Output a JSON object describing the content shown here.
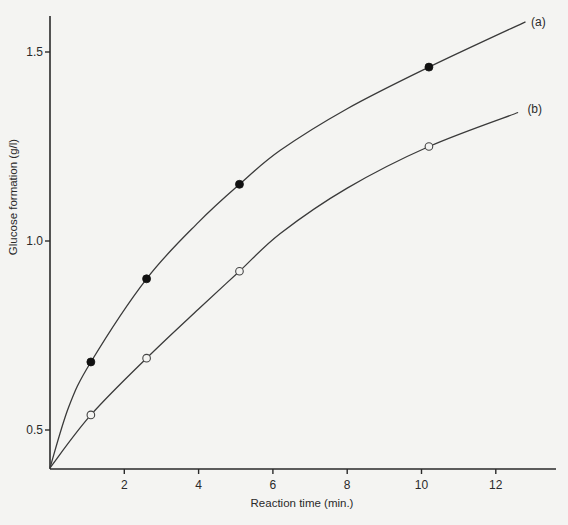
{
  "chart_data": {
    "type": "line",
    "title": "",
    "xlabel": "Reaction time (min.)",
    "ylabel": "Glucose formation (g/l)",
    "xlim": [
      0,
      13.6
    ],
    "ylim": [
      0.4,
      1.62
    ],
    "xticks": [
      2,
      4,
      6,
      8,
      10,
      12
    ],
    "xtick_labels": [
      "2",
      "4",
      "6",
      "8",
      "10",
      "12"
    ],
    "yticks": [
      0.5,
      1.0,
      1.5
    ],
    "ytick_labels": [
      "0.5",
      "1.0",
      "1.5"
    ],
    "grid": false,
    "legend": "inline curve labels at right end",
    "series": [
      {
        "name": "(a)",
        "marker": "filled-circle",
        "points": [
          {
            "x": 1.1,
            "y": 0.68
          },
          {
            "x": 2.6,
            "y": 0.9
          },
          {
            "x": 5.1,
            "y": 1.15
          },
          {
            "x": 10.2,
            "y": 1.46
          }
        ],
        "fit_curve": [
          {
            "x": 0,
            "y": 0.4
          },
          {
            "x": 0.5,
            "y": 0.56
          },
          {
            "x": 1.1,
            "y": 0.68
          },
          {
            "x": 2.6,
            "y": 0.9
          },
          {
            "x": 4.0,
            "y": 1.05
          },
          {
            "x": 5.1,
            "y": 1.15
          },
          {
            "x": 6.2,
            "y": 1.24
          },
          {
            "x": 8.0,
            "y": 1.35
          },
          {
            "x": 10.2,
            "y": 1.46
          },
          {
            "x": 12.8,
            "y": 1.58
          }
        ],
        "label_anchor": {
          "x": 12.95,
          "y": 1.58
        }
      },
      {
        "name": "(b)",
        "marker": "open-circle",
        "points": [
          {
            "x": 1.1,
            "y": 0.54
          },
          {
            "x": 2.6,
            "y": 0.69
          },
          {
            "x": 5.1,
            "y": 0.92
          },
          {
            "x": 10.2,
            "y": 1.25
          }
        ],
        "fit_curve": [
          {
            "x": 0,
            "y": 0.4
          },
          {
            "x": 1.1,
            "y": 0.54
          },
          {
            "x": 2.6,
            "y": 0.69
          },
          {
            "x": 4.0,
            "y": 0.82
          },
          {
            "x": 5.1,
            "y": 0.92
          },
          {
            "x": 6.2,
            "y": 1.02
          },
          {
            "x": 8.0,
            "y": 1.14
          },
          {
            "x": 10.2,
            "y": 1.25
          },
          {
            "x": 12.6,
            "y": 1.34
          }
        ],
        "label_anchor": {
          "x": 12.85,
          "y": 1.35
        }
      }
    ]
  }
}
